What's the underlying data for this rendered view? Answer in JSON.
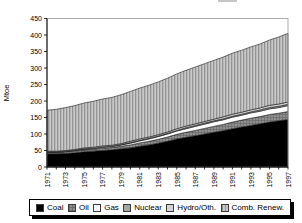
{
  "chart_data": {
    "type": "area",
    "stacked": true,
    "title": "",
    "ylabel": "Mtoe",
    "xlabel": "",
    "ylim": [
      0,
      450
    ],
    "yticks": [
      0,
      50,
      100,
      150,
      200,
      250,
      300,
      350,
      400,
      450
    ],
    "x": [
      1971,
      1972,
      1973,
      1974,
      1975,
      1976,
      1977,
      1978,
      1979,
      1980,
      1981,
      1982,
      1983,
      1984,
      1985,
      1986,
      1987,
      1988,
      1989,
      1990,
      1991,
      1992,
      1993,
      1994,
      1995,
      1996,
      1997
    ],
    "xtick_labels": [
      1971,
      1973,
      1975,
      1977,
      1979,
      1981,
      1983,
      1985,
      1987,
      1989,
      1991,
      1993,
      1995,
      1997
    ],
    "grid": false,
    "legend_position": "bottom",
    "series": [
      {
        "name": "Coal",
        "values": [
          40,
          40,
          41,
          43,
          46,
          48,
          50,
          52,
          55,
          58,
          63,
          67,
          72,
          78,
          85,
          90,
          95,
          100,
          105,
          110,
          116,
          121,
          126,
          131,
          136,
          140,
          144
        ]
      },
      {
        "name": "Oil",
        "values": [
          4,
          4,
          5,
          5,
          6,
          6,
          7,
          7,
          8,
          9,
          10,
          11,
          12,
          13,
          14,
          15,
          16,
          17,
          18,
          19,
          20,
          21,
          22,
          22,
          23,
          23,
          24
        ]
      },
      {
        "name": "Gas",
        "values": [
          1,
          1,
          1,
          2,
          2,
          2,
          3,
          3,
          4,
          5,
          6,
          7,
          8,
          9,
          10,
          11,
          12,
          13,
          14,
          14,
          15,
          15,
          16,
          16,
          17,
          17,
          18
        ]
      },
      {
        "name": "Nuclear",
        "values": [
          1,
          1,
          1,
          1,
          1,
          1,
          1,
          1,
          1,
          2,
          2,
          2,
          2,
          2,
          2,
          3,
          3,
          3,
          3,
          3,
          3,
          3,
          3,
          4,
          4,
          4,
          4
        ]
      },
      {
        "name": "Hydro/Oth.",
        "values": [
          2,
          2,
          2,
          2,
          3,
          3,
          3,
          3,
          3,
          4,
          4,
          4,
          4,
          4,
          5,
          5,
          5,
          5,
          5,
          6,
          6,
          6,
          6,
          6,
          7,
          7,
          7
        ]
      },
      {
        "name": "Comb. Renew.",
        "values": [
          124,
          127,
          130,
          133,
          136,
          139,
          142,
          145,
          148,
          151,
          154,
          157,
          160,
          163,
          166,
          169,
          172,
          175,
          178,
          181,
          185,
          188,
          191,
          194,
          198,
          203,
          208
        ]
      }
    ],
    "colors": {
      "coal": "#000000",
      "oil": "#8f8f8f",
      "oil_grid_line": "#6b6b6b",
      "gas": "#ffffff",
      "nuclear": "#a6a6a6",
      "hydro": "#d4d4d4",
      "comb_renew": "#c8c8c8",
      "comb_renew_stripe": "#949494",
      "axis": "#000000",
      "frame": "#9a9a9a",
      "boundary": "#1a1a1a"
    }
  }
}
